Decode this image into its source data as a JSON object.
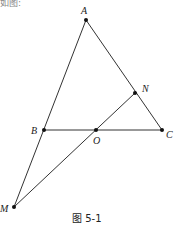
{
  "top_fragment": "如图:",
  "caption": "图 5-1",
  "points": [
    {
      "name": "A",
      "x": 86,
      "y": 20,
      "lx": 81,
      "ly": 14
    },
    {
      "name": "N",
      "x": 135,
      "y": 93,
      "lx": 142,
      "ly": 92
    },
    {
      "name": "B",
      "x": 44,
      "y": 130,
      "lx": 31,
      "ly": 134
    },
    {
      "name": "O",
      "x": 96,
      "y": 130,
      "lx": 93,
      "ly": 144
    },
    {
      "name": "C",
      "x": 162,
      "y": 130,
      "lx": 166,
      "ly": 138
    },
    {
      "name": "M",
      "x": 14,
      "y": 207,
      "lx": 0,
      "ly": 212
    }
  ],
  "segments": [
    [
      "A",
      "M"
    ],
    [
      "A",
      "C"
    ],
    [
      "B",
      "C"
    ],
    [
      "M",
      "N"
    ]
  ],
  "colors": {
    "line": "#333333",
    "point": "#111111"
  }
}
